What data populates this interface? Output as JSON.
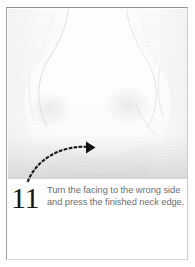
{
  "page": {
    "type": "instruction-step-page",
    "width": 195,
    "height": 267,
    "background_color": "#ffffff",
    "border_color": "#8e9093"
  },
  "photo": {
    "subject": "white garment neckline and shoulder area",
    "description": "Close-up photograph of a white sewn garment showing the finished neck edge with facing turned to the inside",
    "background_color": "#fbfbfa",
    "shadow_color": "#ededed",
    "alt": "white fabric garment neckline"
  },
  "annotation": {
    "arrow": {
      "icon": "dotted-curved-arrow",
      "style": "dotted",
      "color": "#1a1a1a",
      "dot_count": 18,
      "start_x": 28,
      "start_y": 181,
      "end_x": 90,
      "end_y": 147,
      "direction": "right",
      "arrowhead": "solid-triangle"
    }
  },
  "caption": {
    "step_number": "11",
    "step_number_color": "#161616",
    "text_color": "#6c6e70",
    "lines": [
      "Turn the facing to the wrong side",
      "and press the finished neck edge."
    ],
    "full_text": "Turn the facing to the wrong side and press the finished neck edge."
  }
}
